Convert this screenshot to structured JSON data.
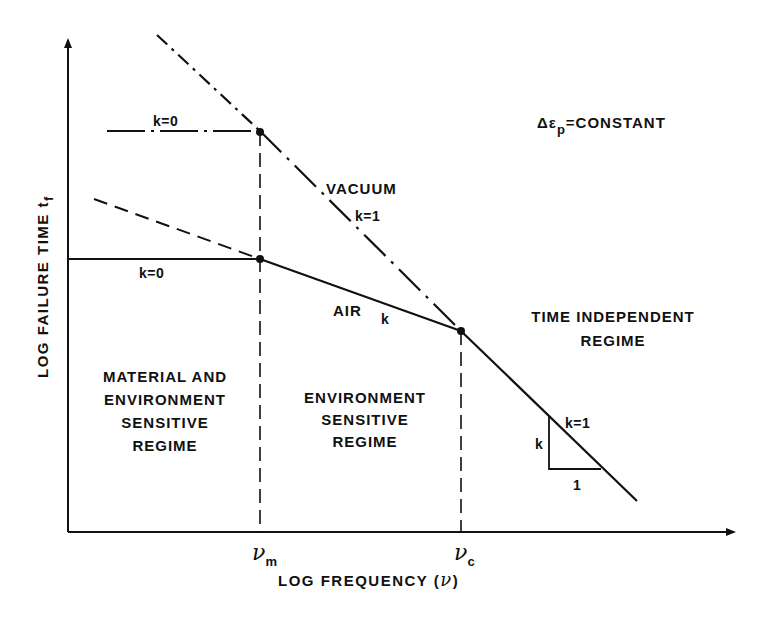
{
  "figure": {
    "background": "#ffffff",
    "ink": "#111111",
    "axes": {
      "x_label": "LOG FREQUENCY (",
      "x_label_symbol": "ν",
      "x_label_close": ")",
      "y_label": "LOG FAILURE TIME t",
      "y_label_sub": "f",
      "x_ticks": [
        {
          "symbol": "ν",
          "sub": "m"
        },
        {
          "symbol": "ν",
          "sub": "c"
        }
      ]
    },
    "condition": {
      "prefix": "Δε",
      "sub": "p",
      "suffix": "=CONSTANT"
    },
    "curves": {
      "vacuum": {
        "name": "VACUUM",
        "slope_label": "k=1",
        "plateau_label": "k=0",
        "style": "dash-dot"
      },
      "air": {
        "name": "AIR",
        "slope_label": "k",
        "plateau_label": "k=0",
        "style": "solid"
      },
      "air_extension_style": "dashed"
    },
    "regimes": {
      "material_env": [
        "MATERIAL AND",
        "ENVIRONMENT",
        "SENSITIVE",
        "REGIME"
      ],
      "environment": [
        "ENVIRONMENT",
        "SENSITIVE",
        "REGIME"
      ],
      "time_independent": [
        "TIME INDEPENDENT",
        "REGIME"
      ]
    },
    "slope_triangle": {
      "line_label": "k=1",
      "rise_label": "k",
      "run_label": "1"
    }
  }
}
